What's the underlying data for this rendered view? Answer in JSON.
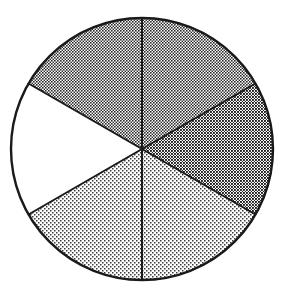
{
  "figure": {
    "kind": "pie-fraction-diagram",
    "background_color": "#ffffff",
    "outline_color": "#1a1a1a",
    "outline_width": 2,
    "divider_color": "#1a1a1a",
    "divider_width": 2,
    "center_x": 142,
    "center_y": 149,
    "radius": 131
  },
  "chart_data": {
    "type": "pie",
    "xlabel": "",
    "ylabel": "",
    "grid": false,
    "legend": "none",
    "total_slices": 6,
    "shaded_slices": 4,
    "unshaded_slices": 2,
    "fraction_shaded": "4/6",
    "slice_angle_degrees": 60,
    "categories": [
      "top-right sector",
      "right sector",
      "bottom-right sector",
      "bottom-left sector",
      "left sector",
      "top-left sector"
    ],
    "values": [
      60,
      60,
      60,
      60,
      60,
      60
    ],
    "series": [
      {
        "name": "sector shading",
        "values": [
          {
            "name": "top-right sector",
            "start_angle": 30,
            "end_angle": 90,
            "shade": "medium-gray",
            "fill": "#808080",
            "pattern": "halftone-50",
            "shaded": true
          },
          {
            "name": "right sector",
            "start_angle": 330,
            "end_angle": 30,
            "shade": "dark-gray",
            "fill": "#6e6e6e",
            "pattern": "halftone-60",
            "shaded": true
          },
          {
            "name": "bottom-right sector",
            "start_angle": 270,
            "end_angle": 330,
            "shade": "light-gray",
            "fill": "#c4c4c4",
            "pattern": "halftone-25",
            "shaded": true
          },
          {
            "name": "bottom-left sector",
            "start_angle": 210,
            "end_angle": 270,
            "shade": "light-gray",
            "fill": "#c4c4c4",
            "pattern": "halftone-25",
            "shaded": true
          },
          {
            "name": "left sector",
            "start_angle": 150,
            "end_angle": 210,
            "shade": "white",
            "fill": "#ffffff",
            "pattern": "none",
            "shaded": false
          },
          {
            "name": "top-left sector",
            "start_angle": 90,
            "end_angle": 150,
            "shade": "medium-gray",
            "fill": "#808080",
            "pattern": "halftone-50",
            "shaded": true
          }
        ]
      }
    ],
    "dividers": [
      {
        "name": "divider-top",
        "angle": 90,
        "x": 142,
        "y": 18
      },
      {
        "name": "divider-upper-right",
        "angle": 30,
        "x": 255,
        "y": 84
      },
      {
        "name": "divider-lower-right",
        "angle": 330,
        "x": 255,
        "y": 214
      },
      {
        "name": "divider-bottom",
        "angle": 270,
        "x": 142,
        "y": 280
      },
      {
        "name": "divider-lower-left",
        "angle": 210,
        "x": 29,
        "y": 214
      },
      {
        "name": "divider-upper-left",
        "angle": 150,
        "x": 29,
        "y": 84
      }
    ]
  }
}
